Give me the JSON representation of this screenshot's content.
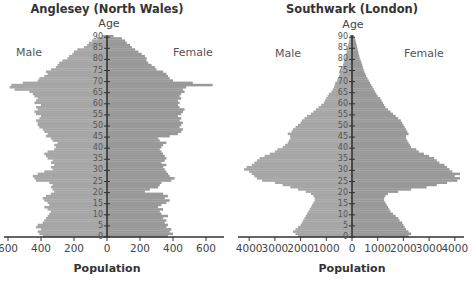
{
  "figure": {
    "panels": [
      {
        "title": "Anglesey (North Wales)",
        "age_label": "Age",
        "male_label": "Male",
        "female_label": "Female",
        "xlabel": "Population",
        "xtick_labels": [
          "600",
          "400",
          "200",
          "0",
          "200",
          "400",
          "600"
        ]
      },
      {
        "title": "Southwark (London)",
        "age_label": "Age",
        "male_label": "Male",
        "female_label": "Female",
        "xlabel": "Population",
        "xtick_labels": [
          "4000",
          "3000",
          "2000",
          "1000",
          "0",
          "1000",
          "2000",
          "3000",
          "4000"
        ]
      }
    ],
    "colors": {
      "male_bar": "#a6a6a6",
      "female_bar": "#999999",
      "axis": "#333333",
      "background": "#ffffff"
    }
  },
  "chart_data": [
    {
      "type": "bar",
      "orientation": "horizontal",
      "subtype": "population_pyramid",
      "title": "Anglesey (North Wales)",
      "xlabel": "Population",
      "ylabel": "Age",
      "xlim": [
        -700,
        700
      ],
      "xticks": [
        -600,
        -400,
        -200,
        0,
        200,
        400,
        600
      ],
      "xtick_labels": [
        "600",
        "400",
        "200",
        "0",
        "200",
        "400",
        "600"
      ],
      "yticks": [
        0,
        5,
        10,
        15,
        20,
        25,
        30,
        35,
        40,
        45,
        50,
        55,
        60,
        65,
        70,
        75,
        80,
        85,
        90
      ],
      "ylim": [
        0,
        90
      ],
      "grid": false,
      "legend": {
        "left": "Male",
        "right": "Female"
      },
      "ages": [
        0,
        1,
        2,
        3,
        4,
        5,
        6,
        7,
        8,
        9,
        10,
        11,
        12,
        13,
        14,
        15,
        16,
        17,
        18,
        19,
        20,
        21,
        22,
        23,
        24,
        25,
        26,
        27,
        28,
        29,
        30,
        31,
        32,
        33,
        34,
        35,
        36,
        37,
        38,
        39,
        40,
        41,
        42,
        43,
        44,
        45,
        46,
        47,
        48,
        49,
        50,
        51,
        52,
        53,
        54,
        55,
        56,
        57,
        58,
        59,
        60,
        61,
        62,
        63,
        64,
        65,
        66,
        67,
        68,
        69,
        70,
        71,
        72,
        73,
        74,
        75,
        76,
        77,
        78,
        79,
        80,
        81,
        82,
        83,
        84,
        85,
        86,
        87,
        88,
        89,
        90
      ],
      "series": [
        {
          "name": "Male",
          "values": [
            390,
            410,
            420,
            400,
            430,
            420,
            390,
            380,
            370,
            360,
            350,
            340,
            360,
            380,
            350,
            360,
            380,
            390,
            370,
            340,
            320,
            330,
            340,
            330,
            350,
            430,
            440,
            450,
            420,
            380,
            330,
            340,
            320,
            340,
            330,
            360,
            370,
            380,
            360,
            320,
            310,
            320,
            300,
            330,
            340,
            370,
            360,
            380,
            390,
            410,
            420,
            420,
            430,
            410,
            400,
            430,
            440,
            420,
            430,
            400,
            440,
            430,
            420,
            440,
            450,
            470,
            560,
            590,
            580,
            510,
            420,
            410,
            380,
            360,
            370,
            340,
            310,
            300,
            290,
            270,
            240,
            230,
            210,
            200,
            180,
            140,
            120,
            110,
            90,
            60,
            30
          ]
        },
        {
          "name": "Female",
          "values": [
            370,
            400,
            380,
            390,
            360,
            370,
            350,
            360,
            340,
            370,
            330,
            320,
            340,
            310,
            330,
            360,
            380,
            350,
            370,
            340,
            230,
            260,
            310,
            320,
            330,
            390,
            410,
            380,
            370,
            360,
            350,
            340,
            360,
            330,
            350,
            360,
            350,
            340,
            330,
            320,
            330,
            340,
            360,
            320,
            310,
            380,
            430,
            450,
            460,
            440,
            450,
            460,
            440,
            450,
            430,
            450,
            460,
            470,
            440,
            430,
            440,
            430,
            450,
            440,
            450,
            470,
            460,
            480,
            640,
            520,
            400,
            380,
            370,
            360,
            340,
            300,
            290,
            270,
            250,
            240,
            240,
            230,
            210,
            190,
            170,
            150,
            140,
            120,
            110,
            90,
            40
          ]
        }
      ]
    },
    {
      "type": "bar",
      "orientation": "horizontal",
      "subtype": "population_pyramid",
      "title": "Southwark (London)",
      "xlabel": "Population",
      "ylabel": "Age",
      "xlim": [
        -4300,
        4300
      ],
      "xticks": [
        -4000,
        -3000,
        -2000,
        -1000,
        0,
        1000,
        2000,
        3000,
        4000
      ],
      "xtick_labels": [
        "4000",
        "3000",
        "2000",
        "1000",
        "0",
        "1000",
        "2000",
        "3000",
        "4000"
      ],
      "yticks": [
        0,
        5,
        10,
        15,
        20,
        25,
        30,
        35,
        40,
        45,
        50,
        55,
        60,
        65,
        70,
        75,
        80,
        85,
        90
      ],
      "ylim": [
        0,
        90
      ],
      "grid": false,
      "legend": {
        "left": "Male",
        "right": "Female"
      },
      "ages": [
        0,
        1,
        2,
        3,
        4,
        5,
        6,
        7,
        8,
        9,
        10,
        11,
        12,
        13,
        14,
        15,
        16,
        17,
        18,
        19,
        20,
        21,
        22,
        23,
        24,
        25,
        26,
        27,
        28,
        29,
        30,
        31,
        32,
        33,
        34,
        35,
        36,
        37,
        38,
        39,
        40,
        41,
        42,
        43,
        44,
        45,
        46,
        47,
        48,
        49,
        50,
        51,
        52,
        53,
        54,
        55,
        56,
        57,
        58,
        59,
        60,
        61,
        62,
        63,
        64,
        65,
        66,
        67,
        68,
        69,
        70,
        71,
        72,
        73,
        74,
        75,
        76,
        77,
        78,
        79,
        80,
        81,
        82,
        83,
        84,
        85,
        86,
        87,
        88,
        89,
        90
      ],
      "series": [
        {
          "name": "Male",
          "values": [
            2100,
            2200,
            2300,
            2200,
            2100,
            2000,
            1950,
            1900,
            1850,
            1800,
            1750,
            1700,
            1650,
            1600,
            1550,
            1500,
            1450,
            1450,
            1500,
            1600,
            1800,
            2100,
            2400,
            2700,
            3000,
            3500,
            3700,
            3800,
            3900,
            4000,
            4200,
            4100,
            3900,
            3800,
            3700,
            3600,
            3400,
            3200,
            3000,
            2900,
            2700,
            2600,
            2500,
            2450,
            2400,
            2400,
            2500,
            2350,
            2300,
            2200,
            2100,
            2000,
            1950,
            1850,
            1750,
            1600,
            1500,
            1400,
            1300,
            1200,
            1100,
            1050,
            1000,
            950,
            900,
            800,
            750,
            700,
            680,
            650,
            580,
            550,
            500,
            480,
            450,
            400,
            380,
            350,
            330,
            300,
            270,
            250,
            230,
            210,
            200,
            170,
            150,
            130,
            110,
            90,
            80
          ]
        },
        {
          "name": "Female",
          "values": [
            2200,
            2300,
            2200,
            2100,
            2050,
            2000,
            1950,
            1850,
            1800,
            1700,
            1600,
            1500,
            1450,
            1400,
            1350,
            1300,
            1250,
            1250,
            1300,
            1400,
            1800,
            2300,
            2900,
            3300,
            3700,
            4100,
            4200,
            4000,
            4200,
            3900,
            3800,
            3700,
            3600,
            3400,
            3300,
            3200,
            3000,
            2800,
            2600,
            2500,
            2300,
            2250,
            2200,
            2150,
            2100,
            2100,
            2200,
            2150,
            2100,
            2050,
            2000,
            1950,
            1900,
            1800,
            1700,
            1600,
            1500,
            1400,
            1300,
            1250,
            1200,
            1150,
            1100,
            1000,
            950,
            900,
            850,
            800,
            750,
            700,
            650,
            600,
            550,
            520,
            480,
            450,
            420,
            400,
            370,
            340,
            300,
            280,
            260,
            240,
            220,
            200,
            180,
            160,
            140,
            110,
            80
          ]
        }
      ]
    }
  ]
}
